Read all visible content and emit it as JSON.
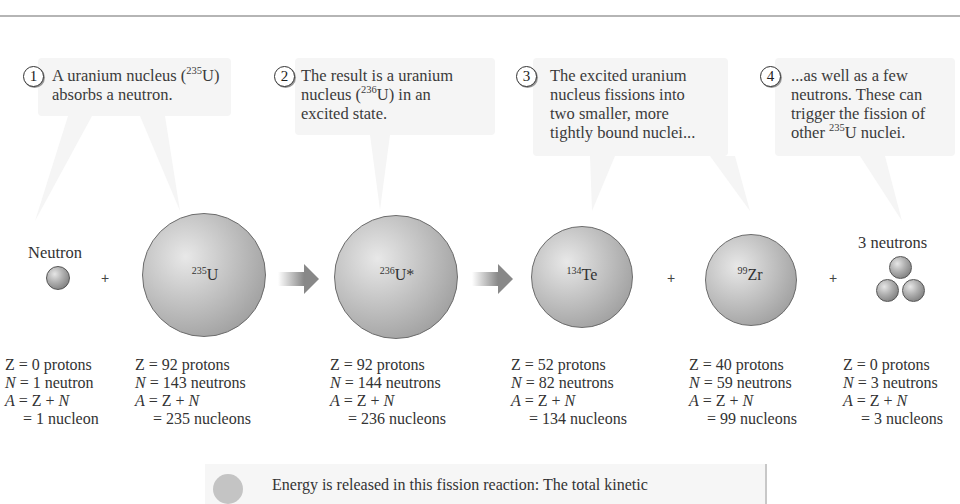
{
  "callouts": [
    {
      "number": "1",
      "text_pre": "A uranium nucleus (",
      "sup": "235",
      "text_post": "U)",
      "line2": "absorbs a neutron."
    },
    {
      "number": "2",
      "line1": "The result is a uranium",
      "text_pre": "nucleus (",
      "sup": "236",
      "text_post": "U) in an",
      "line3": "excited state."
    },
    {
      "number": "3",
      "line1": "The excited uranium",
      "line2": "nucleus fissions into",
      "line3": "two smaller, more",
      "line4": "tightly bound nuclei..."
    },
    {
      "number": "4",
      "line1": "...as well as a few",
      "line2": "neutrons. These can",
      "line3": "trigger the fission of",
      "text_pre": "other ",
      "sup": "235",
      "text_post": "U nuclei."
    }
  ],
  "particles": [
    {
      "label": "Neutron",
      "sup": "",
      "symbol": "",
      "Z": "Z = 0 protons",
      "N": "N = 1 neutron",
      "A": "A = Z + N",
      "A_val": "= 1 nucleon"
    },
    {
      "label": "",
      "sup": "235",
      "symbol": "U",
      "Z": "Z = 92 protons",
      "N": "N = 143 neutrons",
      "A": "A = Z + N",
      "A_val": "= 235 nucleons"
    },
    {
      "label": "",
      "sup": "236",
      "symbol": "U*",
      "Z": "Z = 92 protons",
      "N": "N = 144 neutrons",
      "A": "A = Z + N",
      "A_val": "= 236 nucleons"
    },
    {
      "label": "",
      "sup": "134",
      "symbol": "Te",
      "Z": "Z = 52 protons",
      "N": "N = 82 neutrons",
      "A": "A = Z + N",
      "A_val": "= 134 nucleons"
    },
    {
      "label": "",
      "sup": "99",
      "symbol": "Zr",
      "Z": "Z = 40 protons",
      "N": "N = 59 neutrons",
      "A": "A = Z + N",
      "A_val": "= 99 nucleons"
    },
    {
      "label": "3 neutrons",
      "sup": "",
      "symbol": "",
      "Z": "Z = 0 protons",
      "N": "N = 3 neutrons",
      "A": "A = Z + N",
      "A_val": "= 3 nucleons"
    }
  ],
  "operators": {
    "plus": "+"
  },
  "energy_note": {
    "text": "Energy is released in this fission reaction: The total kinetic"
  }
}
